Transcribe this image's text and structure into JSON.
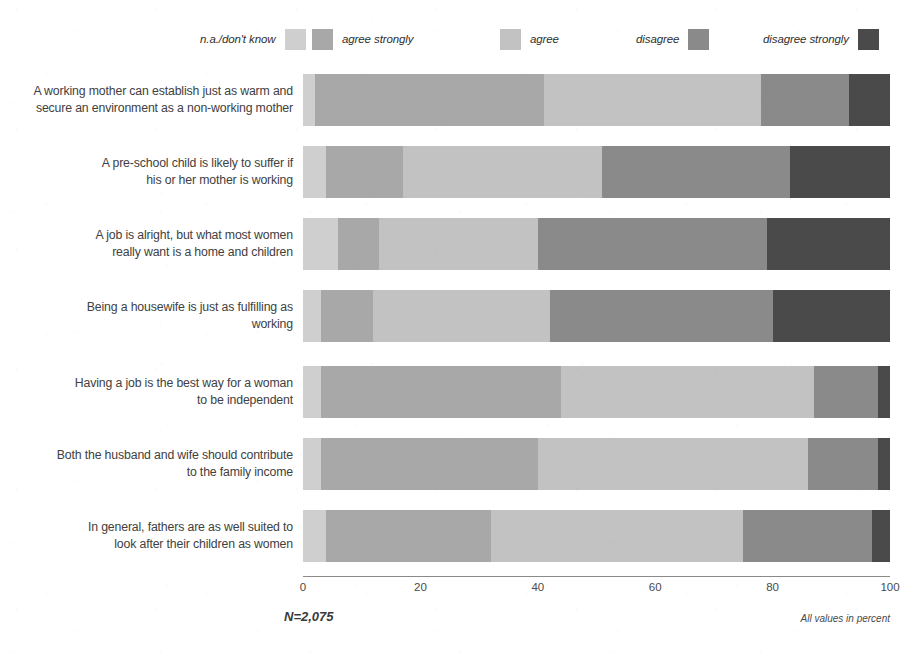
{
  "legend": {
    "items": [
      {
        "label": "n.a./don't know",
        "color": "#cfcfcf",
        "order": "label-first"
      },
      {
        "label": "agree strongly",
        "color": "#a8a8a8",
        "order": "swatch-first"
      },
      {
        "label": "agree",
        "color": "#c2c2c2",
        "order": "swatch-first"
      },
      {
        "label": "disagree",
        "color": "#8a8a8a",
        "order": "label-first"
      },
      {
        "label": "disagree strongly",
        "color": "#4a4a4a",
        "order": "label-first"
      }
    ]
  },
  "axis": {
    "ticks": [
      "0",
      "20",
      "40",
      "60",
      "80",
      "100"
    ],
    "min": 0,
    "max": 100
  },
  "footer": {
    "n_label": "N=2,075",
    "note": "All values in percent"
  },
  "chart_data": {
    "type": "bar",
    "orientation": "horizontal",
    "stacked": true,
    "stacked_100": true,
    "title": "",
    "xlabel": "",
    "ylabel": "",
    "xlim": [
      0,
      100
    ],
    "grid": false,
    "legend_position": "top",
    "value_unit": "percent",
    "sample_size": "N=2,075",
    "categories": [
      "A working mother can establish just as warm and secure an environment as a non-working mother",
      "A pre-school child is likely to suffer if his or her mother is working",
      "A job is alright, but what most women really want is a home and children",
      "Being a housewife is just as fulfilling as working",
      "Having a job is the best way for a woman to be independent",
      "Both the husband and wife should contribute to the family income",
      "In general, fathers are as well suited to look after their children as women"
    ],
    "series": [
      {
        "name": "n.a./don't know",
        "color": "#cfcfcf",
        "values": [
          2,
          4,
          6,
          3,
          3,
          3,
          4
        ]
      },
      {
        "name": "agree strongly",
        "color": "#a8a8a8",
        "values": [
          39,
          13,
          7,
          9,
          41,
          37,
          28
        ]
      },
      {
        "name": "agree",
        "color": "#c2c2c2",
        "values": [
          37,
          34,
          27,
          30,
          43,
          46,
          43
        ]
      },
      {
        "name": "disagree",
        "color": "#8a8a8a",
        "values": [
          15,
          32,
          39,
          38,
          11,
          12,
          22
        ]
      },
      {
        "name": "disagree strongly",
        "color": "#4a4a4a",
        "values": [
          7,
          17,
          21,
          20,
          2,
          2,
          3
        ]
      }
    ]
  },
  "rows": [
    {
      "lines": [
        "A working mother can establish just as warm and",
        "secure an environment as a non-working mother"
      ]
    },
    {
      "lines": [
        "A pre-school child is likely to suffer if",
        "his or her mother is working"
      ]
    },
    {
      "lines": [
        "A job is alright, but what most women",
        "really want is a home and children"
      ]
    },
    {
      "lines": [
        "Being a housewife is just as fulfilling as",
        "working"
      ]
    },
    {
      "lines": [
        "Having a job is the best way for a woman",
        "to be independent"
      ]
    },
    {
      "lines": [
        "Both the husband and wife should contribute",
        "to the family income"
      ]
    },
    {
      "lines": [
        "In general, fathers are as well suited to",
        "look after their children as women"
      ]
    }
  ]
}
